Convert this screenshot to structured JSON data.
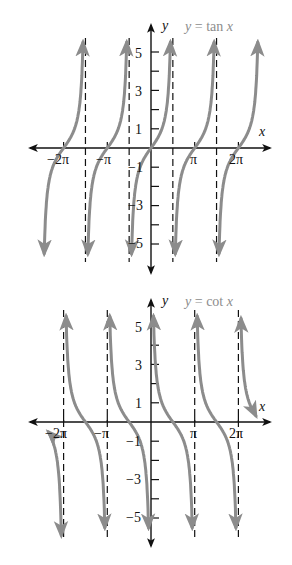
{
  "colors": {
    "curve": "#8c8c8c",
    "axis": "#111111",
    "asymptote": "#111111",
    "title": "#8c8c8c"
  },
  "chart_data": [
    {
      "type": "line",
      "title": "y = tan x",
      "function": "tan",
      "xlabel": "x",
      "ylabel": "y",
      "xlim": [
        -2.5,
        2.6
      ],
      "xlim_units": "pi",
      "ylim": [
        -6,
        6.5
      ],
      "x_ticks": [
        {
          "value": -2,
          "label": "−2π"
        },
        {
          "value": -1,
          "label": "−π"
        },
        {
          "value": 1,
          "label": "π"
        },
        {
          "value": 2,
          "label": "2π"
        }
      ],
      "y_ticks": [
        {
          "value": 5,
          "label": "5"
        },
        {
          "value": 4,
          "label": ""
        },
        {
          "value": 3,
          "label": "3"
        },
        {
          "value": 2,
          "label": ""
        },
        {
          "value": 1,
          "label": "1"
        },
        {
          "value": -1,
          "label": "−1"
        },
        {
          "value": -2,
          "label": ""
        },
        {
          "value": -3,
          "label": "−3"
        },
        {
          "value": -4,
          "label": ""
        },
        {
          "value": -5,
          "label": "−5"
        }
      ],
      "asymptotes_x_pi": [
        -1.5,
        -0.5,
        0.5,
        1.5
      ],
      "branches_center_pi": [
        -2,
        -1,
        0,
        1,
        2
      ],
      "grid": false,
      "legend": "none"
    },
    {
      "type": "line",
      "title": "y = cot x",
      "function": "cot",
      "xlabel": "x",
      "ylabel": "y",
      "xlim": [
        -2.5,
        2.6
      ],
      "xlim_units": "pi",
      "ylim": [
        -6.5,
        6.5
      ],
      "x_ticks": [
        {
          "value": -2,
          "label": "−2π"
        },
        {
          "value": -1,
          "label": "−π"
        },
        {
          "value": 1,
          "label": "π"
        },
        {
          "value": 2,
          "label": "2π"
        }
      ],
      "y_ticks": [
        {
          "value": 5,
          "label": "5"
        },
        {
          "value": 4,
          "label": ""
        },
        {
          "value": 3,
          "label": "3"
        },
        {
          "value": 2,
          "label": ""
        },
        {
          "value": 1,
          "label": "1"
        },
        {
          "value": -1,
          "label": "−1"
        },
        {
          "value": -2,
          "label": ""
        },
        {
          "value": -3,
          "label": "−3"
        },
        {
          "value": -4,
          "label": ""
        },
        {
          "value": -5,
          "label": "−5"
        }
      ],
      "asymptotes_x_pi": [
        -2,
        -1,
        0,
        1,
        2
      ],
      "branches_interval_pi": [
        [
          -2.35,
          -2
        ],
        [
          -2,
          -1
        ],
        [
          -1,
          0
        ],
        [
          0,
          1
        ],
        [
          1,
          2
        ],
        [
          2,
          2.4
        ]
      ],
      "grid": false,
      "legend": "none"
    }
  ],
  "graphs": {
    "tan": {
      "title_y": "y",
      "title_eq": "=",
      "title_fn": "tan",
      "title_x": "x",
      "axis_x_label": "x",
      "axis_y_label": "y",
      "tick_neg2pi": "−2π",
      "tick_negpi": "−π",
      "tick_pi": "π",
      "tick_2pi": "2π",
      "y5": "5",
      "y3": "3",
      "y1": "1",
      "yn1": "−1",
      "yn3": "−3",
      "yn5": "−5"
    },
    "cot": {
      "title_y": "y",
      "title_eq": "=",
      "title_fn": "cot",
      "title_x": "x",
      "axis_x_label": "x",
      "axis_y_label": "y",
      "tick_neg2pi": "−2π",
      "tick_negpi": "−π",
      "tick_pi": "π",
      "tick_2pi": "2π",
      "y5": "5",
      "y3": "3",
      "y1": "1",
      "yn1": "−1",
      "yn3": "−3",
      "yn5": "−5"
    }
  }
}
